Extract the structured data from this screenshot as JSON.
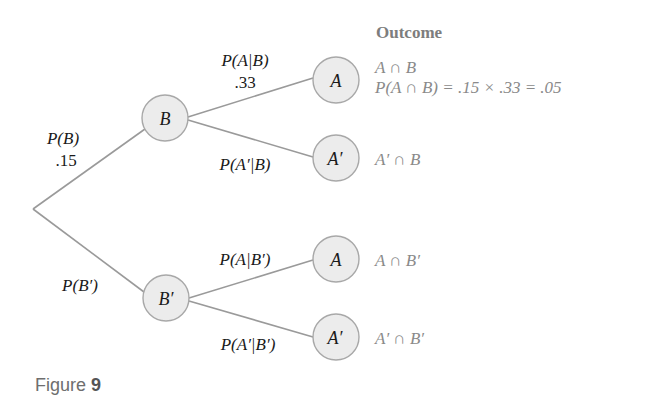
{
  "figure": {
    "caption_prefix": "Figure",
    "caption_number": "9"
  },
  "colors": {
    "branch_line": "#9a9a9a",
    "node_fill": "#ececec",
    "node_stroke": "#a8a8a8",
    "outcome_text": "#8a8a8a",
    "label_text": "#1a1a1a"
  },
  "tree": {
    "first_level": {
      "upper_branch": {
        "label": "P(B)",
        "value": ".15",
        "node": "B"
      },
      "lower_branch": {
        "label": "P(B′)",
        "node": "B′"
      }
    },
    "second_level": {
      "from_B": {
        "upper": {
          "label": "P(A|B)",
          "value": ".33",
          "node": "A"
        },
        "lower": {
          "label": "P(A′|B)",
          "node": "A′"
        }
      },
      "from_B_prime": {
        "upper": {
          "label": "P(A|B′)",
          "node": "A"
        },
        "lower": {
          "label": "P(A′|B′)",
          "node": "A′"
        }
      }
    }
  },
  "outcomes": {
    "heading": "Outcome",
    "items": [
      {
        "event": "A ∩ B",
        "calculation": "P(A ∩ B) = .15 × .33 = .05"
      },
      {
        "event": "A′ ∩ B"
      },
      {
        "event": "A ∩ B′"
      },
      {
        "event": "A′ ∩ B′"
      }
    ]
  }
}
